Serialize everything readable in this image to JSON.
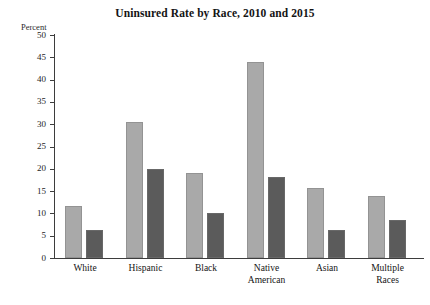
{
  "chart_data": {
    "type": "bar",
    "title": "Uninsured Rate by Race, 2010 and 2015",
    "xlabel": "",
    "ylabel": "Percent",
    "ylim": [
      0,
      50
    ],
    "yticks": [
      "0",
      "5",
      "10",
      "15",
      "20",
      "25",
      "30",
      "35",
      "40",
      "45",
      "50"
    ],
    "grid": false,
    "legend": "none",
    "categories": [
      "White",
      "Hispanic",
      "Black",
      "Native\nAmerican",
      "Asian",
      "Multiple\nRaces"
    ],
    "series": [
      {
        "name": "2010",
        "color": "#a9a9a9",
        "values": [
          11.7,
          30.5,
          19.1,
          44.0,
          15.7,
          13.9
        ]
      },
      {
        "name": "2015",
        "color": "#5b5b5b",
        "values": [
          6.2,
          20.0,
          10.1,
          18.2,
          6.3,
          8.5
        ]
      }
    ]
  },
  "figure": {
    "title": "Uninsured Rate by Race, 2010 and 2015",
    "y_axis_unit_label": "Percent"
  }
}
